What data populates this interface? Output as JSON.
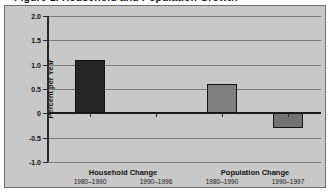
{
  "figure": {
    "title": "Figure 1.  Household and Population Growth",
    "axis_title": "Percent per Year"
  },
  "chart_data": {
    "type": "bar",
    "title": "Figure 1.  Household and Population Growth",
    "xlabel": "",
    "ylabel": "Percent per Year",
    "ylim": [
      -1.0,
      2.0
    ],
    "yticks": [
      "2.0",
      "1.5",
      "1.0",
      "0.5",
      "0",
      "-0.5",
      "-1.0"
    ],
    "ytick_values": [
      2.0,
      1.5,
      1.0,
      0.5,
      0,
      -0.5,
      -1.0
    ],
    "grid": true,
    "legend": "none",
    "groups": [
      {
        "name": "Household Change",
        "periods": [
          "1980–1990",
          "1990–1996"
        ]
      },
      {
        "name": "Population Change",
        "periods": [
          "1980–1990",
          "1990–1997"
        ]
      }
    ],
    "categories": [
      "Household Change 1980–1990",
      "Household Change 1990–1996",
      "Population Change 1980–1990",
      "Population Change 1990–1997"
    ],
    "values": [
      1.1,
      0.0,
      0.6,
      -0.3
    ],
    "bar_colors": [
      "#262626",
      "#262626",
      "#808080",
      "#737373"
    ],
    "bars": [
      {
        "label": "Household Change 1980–1990",
        "value": 1.1,
        "color": "#262626"
      },
      {
        "label": "Household Change 1990–1996",
        "value": 0.0,
        "color": "#262626"
      },
      {
        "label": "Population Change 1980–1990",
        "value": 0.6,
        "color": "#808080"
      },
      {
        "label": "Population Change 1990–1997",
        "value": -0.3,
        "color": "#737373"
      }
    ]
  }
}
